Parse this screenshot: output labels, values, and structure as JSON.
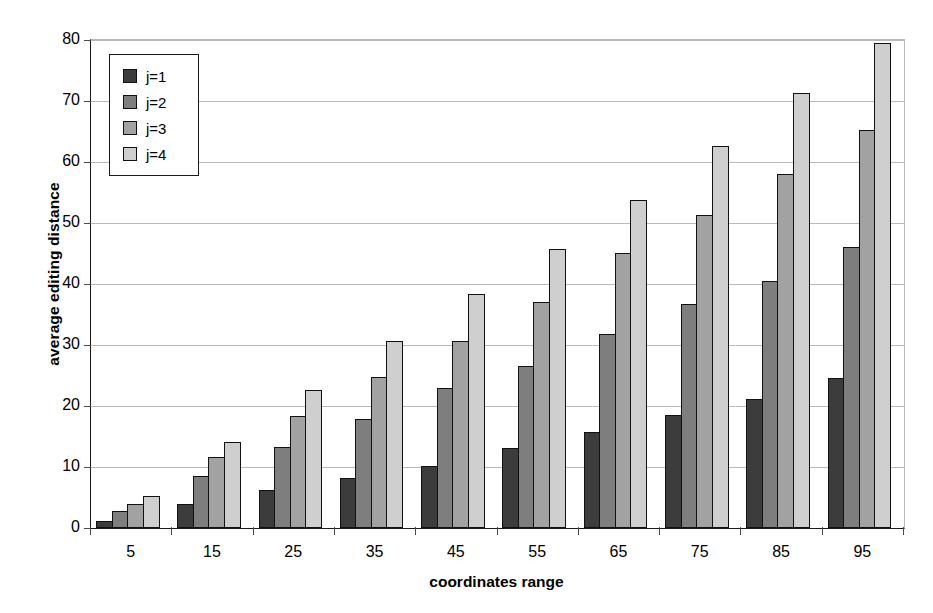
{
  "chart_data": {
    "type": "bar",
    "title": "",
    "xlabel": "coordinates range",
    "ylabel": "average editing distance",
    "categories": [
      "5",
      "15",
      "25",
      "35",
      "45",
      "55",
      "65",
      "75",
      "85",
      "95"
    ],
    "ylim": [
      0,
      80
    ],
    "yticks": [
      0,
      10,
      20,
      30,
      40,
      50,
      60,
      70,
      80
    ],
    "grid": "horizontal",
    "legend_position": "upper-left-inside",
    "series": [
      {
        "name": "j=1",
        "color": "#3c3c3c",
        "values": [
          1.2,
          4.0,
          6.3,
          8.2,
          10.2,
          13.1,
          15.7,
          18.6,
          21.1,
          24.6
        ]
      },
      {
        "name": "j=2",
        "color": "#7e7e7e",
        "values": [
          2.8,
          8.5,
          13.2,
          17.8,
          22.9,
          26.6,
          31.8,
          36.8,
          40.5,
          46.0
        ]
      },
      {
        "name": "j=3",
        "color": "#a2a2a2",
        "values": [
          4.0,
          11.6,
          18.3,
          24.8,
          30.7,
          37.1,
          45.1,
          51.3,
          58.1,
          65.2
        ]
      },
      {
        "name": "j=4",
        "color": "#cfcfcf",
        "values": [
          5.3,
          14.1,
          22.6,
          30.6,
          38.3,
          45.7,
          53.7,
          62.6,
          71.3,
          79.5
        ]
      }
    ]
  }
}
